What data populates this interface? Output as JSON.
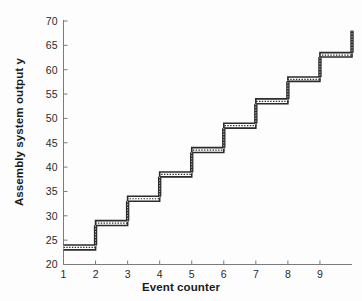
{
  "chart_data": {
    "type": "line",
    "subtype": "step-post",
    "title": "",
    "xlabel": "Event counter",
    "ylabel": "Assembly system output y",
    "xlim": [
      1,
      10
    ],
    "ylim": [
      20,
      70
    ],
    "xticks": [
      1,
      2,
      3,
      4,
      5,
      6,
      7,
      8,
      9
    ],
    "xtick_labels": [
      "1",
      "2",
      "3",
      "4",
      "5",
      "6",
      "7",
      "8",
      "9"
    ],
    "yticks": [
      20,
      25,
      30,
      35,
      40,
      45,
      50,
      55,
      60,
      65,
      70
    ],
    "ytick_labels": [
      "20",
      "25",
      "30",
      "35",
      "40",
      "45",
      "50",
      "55",
      "60",
      "65",
      "70"
    ],
    "grid": false,
    "legend": null,
    "line_style": "thick band (two parallel lines with dotted fill)",
    "line_color": "#2b2b2b",
    "background": "#ffffff",
    "series": [
      {
        "name": "Assembly system output y",
        "x": [
          1,
          2,
          3,
          4,
          5,
          6,
          7,
          8,
          9,
          10
        ],
        "values": [
          23.5,
          28.5,
          33.5,
          38.5,
          43.5,
          48.5,
          53.5,
          58.0,
          63.0,
          68.0
        ],
        "band_lower": [
          23.0,
          28.0,
          33.0,
          38.0,
          43.0,
          48.0,
          53.0,
          57.6,
          62.6,
          68.0
        ],
        "band_upper": [
          24.0,
          29.0,
          34.0,
          39.0,
          44.0,
          49.0,
          54.0,
          58.5,
          63.5,
          68.0
        ]
      }
    ]
  },
  "axes": {
    "y_axis_title": "Assembly system output y",
    "x_axis_title": "Event counter"
  }
}
